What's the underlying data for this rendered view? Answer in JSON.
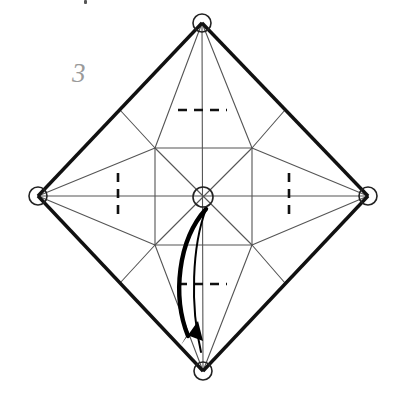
{
  "figure": {
    "step_label": "3",
    "step_label_color": "#9a9a9a",
    "background_color": "#ffffff",
    "ink_color": "#1a1a1a",
    "thin_crease_color": "#555555",
    "arrow_color": "#000000"
  },
  "geometry": {
    "shape": "diamond",
    "vertices": {
      "top": {
        "label": "top-vertex",
        "x": 202,
        "y": 23
      },
      "right": {
        "label": "right-vertex",
        "x": 368,
        "y": 196
      },
      "bottom": {
        "label": "bottom-vertex",
        "x": 203,
        "y": 371
      },
      "left": {
        "label": "left-vertex",
        "x": 38,
        "y": 196
      }
    },
    "center": {
      "label": "center-marker",
      "x": 203,
      "y": 197
    },
    "inner_square": {
      "top_left": {
        "x": 155,
        "y": 148
      },
      "top_right": {
        "x": 252,
        "y": 148
      },
      "bottom_right": {
        "x": 252,
        "y": 245
      },
      "bottom_left": {
        "x": 155,
        "y": 245
      }
    },
    "edge_midpoints": {
      "upper_left": {
        "x": 120,
        "y": 110
      },
      "upper_right": {
        "x": 285,
        "y": 110
      },
      "lower_right": {
        "x": 285,
        "y": 283
      },
      "lower_left": {
        "x": 120,
        "y": 283
      }
    },
    "vertex_marker_radius": 9,
    "center_marker_radius": 10
  },
  "fold_marks": [
    {
      "name": "dashed-mark-top",
      "orientation": "horizontal",
      "x1": 178,
      "y1": 110,
      "x2": 227,
      "y2": 110
    },
    {
      "name": "dashed-mark-bottom",
      "orientation": "horizontal",
      "x1": 178,
      "y1": 284,
      "x2": 227,
      "y2": 284
    },
    {
      "name": "dashed-mark-left",
      "orientation": "vertical",
      "x1": 118,
      "y1": 173,
      "x2": 118,
      "y2": 221
    },
    {
      "name": "dashed-mark-right",
      "orientation": "vertical",
      "x1": 289,
      "y1": 173,
      "x2": 289,
      "y2": 221
    }
  ],
  "fold_arrow": {
    "name": "fold-direction-arrow",
    "description": "curved fold arrow from center to bottom vertex",
    "start": {
      "x": 205,
      "y": 208
    },
    "end": {
      "x": 192,
      "y": 340
    },
    "control": {
      "x": 160,
      "y": 268
    },
    "arrowhead_angle_deg": 250
  },
  "legend": {
    "vertex_marker": "circle-vertex-marker",
    "center_marker": "circle-x-center-marker",
    "valley_fold": "dashed-line",
    "outline": "thick-solid-line",
    "crease": "thin-solid-line"
  }
}
